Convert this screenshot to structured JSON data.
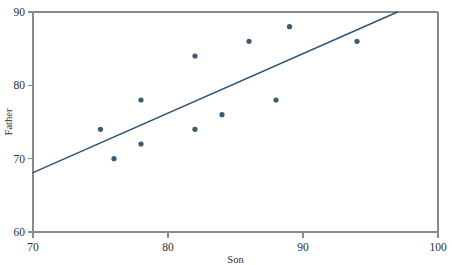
{
  "chart_data": {
    "type": "scatter",
    "title": "",
    "xlabel": "Son",
    "ylabel": "Father",
    "xlim": [
      70,
      100
    ],
    "ylim": [
      60,
      90
    ],
    "xticks": [
      70,
      80,
      90,
      100
    ],
    "xtick_labels": [
      "70",
      "80",
      "90",
      "100"
    ],
    "yticks": [
      60,
      70,
      80,
      90
    ],
    "ytick_labels": [
      "60",
      "70",
      "80",
      "90"
    ],
    "grid": false,
    "legend": false,
    "point_color": "#3d5a70",
    "line_color": "#2d5573",
    "axis_color": "#8a8a8a",
    "points": [
      {
        "x": 75,
        "y": 74
      },
      {
        "x": 76,
        "y": 70
      },
      {
        "x": 78,
        "y": 78
      },
      {
        "x": 78,
        "y": 72
      },
      {
        "x": 82,
        "y": 84
      },
      {
        "x": 82,
        "y": 74
      },
      {
        "x": 84,
        "y": 76
      },
      {
        "x": 86,
        "y": 86
      },
      {
        "x": 88,
        "y": 78
      },
      {
        "x": 89,
        "y": 88
      },
      {
        "x": 94,
        "y": 86
      }
    ],
    "series": [
      {
        "name": "Father vs Son heights",
        "x": [
          75,
          76,
          78,
          78,
          82,
          82,
          84,
          86,
          88,
          89,
          94
        ],
        "values": [
          74,
          70,
          78,
          72,
          84,
          74,
          76,
          86,
          78,
          88,
          86
        ]
      }
    ],
    "fit_line": {
      "name": "regression line",
      "x_start": 70,
      "y_start": 68.1,
      "x_end": 97,
      "y_end": 90.0
    }
  }
}
